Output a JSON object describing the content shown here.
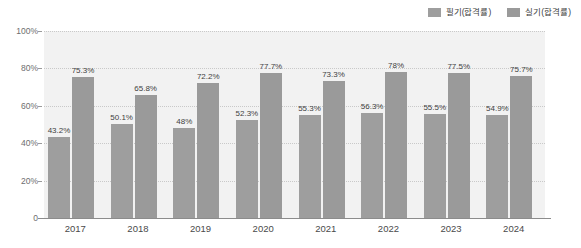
{
  "chart_data": {
    "type": "bar",
    "title": "",
    "subtitle": "",
    "xlabel": "",
    "ylabel": "",
    "categories": [
      "2017",
      "2018",
      "2019",
      "2020",
      "2021",
      "2022",
      "2023",
      "2024"
    ],
    "series": [
      {
        "name": "필기(합격률)",
        "color": "#9e9e9e",
        "values": [
          43.2,
          50.1,
          48,
          52.3,
          55.3,
          56.3,
          55.5,
          54.9
        ],
        "labels": [
          "43.2%",
          "50.1%",
          "48%",
          "52.3%",
          "55.3%",
          "56.3%",
          "55.5%",
          "54.9%"
        ]
      },
      {
        "name": "실기(합격률)",
        "color": "#9a9a9a",
        "values": [
          75.3,
          65.8,
          72.2,
          77.7,
          73.3,
          78,
          77.5,
          75.7
        ],
        "labels": [
          "75.3%",
          "65.8%",
          "72.2%",
          "77.7%",
          "73.3%",
          "78%",
          "77.5%",
          "75.7%"
        ]
      }
    ],
    "ylim": [
      0,
      100
    ],
    "yticks": [
      0,
      20,
      40,
      60,
      80,
      100
    ],
    "ytick_labels": [
      "0",
      "20%",
      "40%",
      "60%",
      "80%",
      "100%"
    ],
    "grid": true,
    "grid_style": "dotted-horizontal",
    "legend_position": "top-right",
    "plot_background": "#f2f2f2"
  },
  "legend": {
    "items": [
      {
        "label": "필기(합격률)"
      },
      {
        "label": "실기(합격률)"
      }
    ]
  }
}
